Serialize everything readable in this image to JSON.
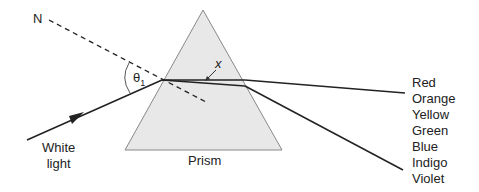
{
  "diagram": {
    "normal_label": "N",
    "angle_label": "θ",
    "angle_subscript": "1",
    "x_label": "x",
    "source_label_line1": "White",
    "source_label_line2": "light",
    "prism_label": "Prism",
    "spectrum": [
      "Red",
      "Orange",
      "Yellow",
      "Green",
      "Blue",
      "Indigo",
      "Violet"
    ],
    "colors": {
      "prism_fill": "#e6e6e6",
      "prism_stroke": "#777777",
      "ray": "#222222"
    }
  }
}
